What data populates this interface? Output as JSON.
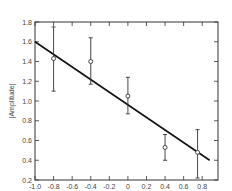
{
  "chart_data": {
    "type": "scatter",
    "title": "",
    "xlabel": "",
    "ylabel": "|Amplitude|",
    "xlim": [
      -1.0,
      0.9
    ],
    "ylim": [
      0.2,
      1.8
    ],
    "grid": false,
    "legend": null,
    "x_ticks": [
      "-1.0",
      "-0.8",
      "-0.6",
      "-0.4",
      "-0.2",
      "0",
      "0.2",
      "0.4",
      "0.6",
      "0.8"
    ],
    "y_ticks": [
      "0.2",
      "0.4",
      "0.6",
      "0.8",
      "1.0",
      "1.2",
      "1.4",
      "1.6",
      "1.8"
    ],
    "series": [
      {
        "name": "measurements",
        "kind": "errorbar",
        "marker": "open-circle",
        "points": [
          {
            "x": -0.8,
            "y": 1.43,
            "ylow": 1.1,
            "yhigh": 1.75
          },
          {
            "x": -0.4,
            "y": 1.4,
            "ylow": 1.17,
            "yhigh": 1.64
          },
          {
            "x": 0.0,
            "y": 1.05,
            "ylow": 0.87,
            "yhigh": 1.24
          },
          {
            "x": 0.4,
            "y": 0.53,
            "ylow": 0.4,
            "yhigh": 0.66
          },
          {
            "x": 0.75,
            "y": 0.48,
            "ylow": 0.22,
            "yhigh": 0.71
          }
        ]
      },
      {
        "name": "linear-fit",
        "kind": "line",
        "x": [
          -1.0,
          0.88
        ],
        "y": [
          1.6,
          0.4
        ]
      }
    ]
  }
}
